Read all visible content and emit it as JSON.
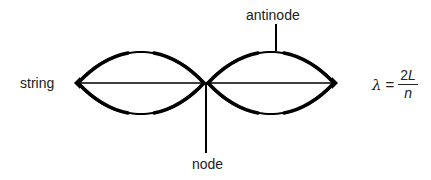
{
  "diagram": {
    "labels": {
      "string": "string",
      "antinode": "antinode",
      "node": "node"
    },
    "formula": {
      "lhs": "λ",
      "equals": "=",
      "numerator_coef": "2",
      "numerator_var": "L",
      "denominator": "n"
    },
    "geometry": {
      "left_end": [
        76,
        83
      ],
      "node_point": [
        206,
        83
      ],
      "right_end": [
        336,
        83
      ],
      "lobe_amplitude": 32,
      "antinode_pointer": {
        "x": 276,
        "y1": 24,
        "y2": 51
      },
      "node_pointer": {
        "x": 206,
        "y1": 83,
        "y2": 153
      }
    },
    "colors": {
      "stroke": "#000000",
      "text": "#222222",
      "background": "#ffffff"
    }
  }
}
